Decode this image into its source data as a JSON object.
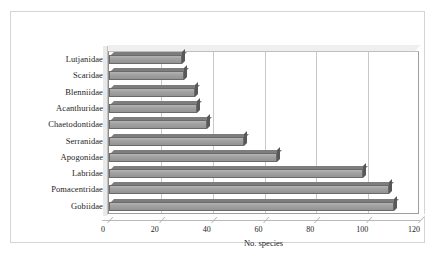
{
  "chart_data": {
    "type": "bar",
    "orientation": "horizontal",
    "title": "",
    "xlabel": "No. species",
    "ylabel": "",
    "xlim": [
      0,
      120
    ],
    "xticks": [
      0,
      20,
      40,
      60,
      80,
      100,
      120
    ],
    "grid": true,
    "legend": false,
    "categories": [
      "Lutjanidae",
      "Scaridae",
      "Blenniidae",
      "Acanthuridae",
      "Chaetodontidae",
      "Serranidae",
      "Apogonidae",
      "Labridae",
      "Pomacentridae",
      "Gobiidae"
    ],
    "values": [
      28,
      29,
      33,
      34,
      38,
      52,
      65,
      98,
      108,
      110
    ],
    "series": [
      {
        "name": "No. species",
        "values": [
          28,
          29,
          33,
          34,
          38,
          52,
          65,
          98,
          108,
          110
        ]
      }
    ],
    "colors": {
      "bar_fill": "#9a9a9a",
      "bar_edge": "#6a6a6a",
      "bar_top_shade": "#7d7d7d",
      "gridline": "#c9c9c9",
      "axis": "#9e9e9e",
      "frame": "#d4d4d4",
      "text": "#1d1d1d",
      "background": "#ffffff"
    }
  },
  "figure": {
    "caption": ""
  }
}
